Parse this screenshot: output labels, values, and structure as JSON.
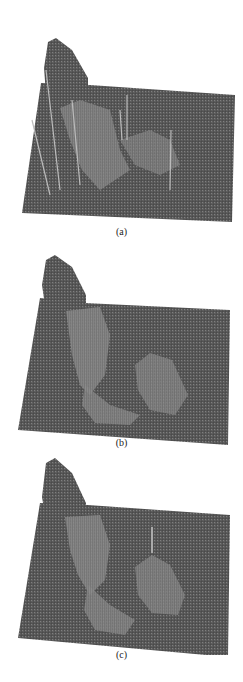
{
  "figure": {
    "panels": [
      {
        "id": "a",
        "label": "(a)",
        "description": "3D surface mesh plot with tall narrow spikes and a raised ridge (noisy)"
      },
      {
        "id": "b",
        "label": "(b)",
        "description": "3D surface mesh plot, smoothed: raised ridge and curved trough, no spikes"
      },
      {
        "id": "c",
        "label": "(c)",
        "description": "3D surface mesh plot, smoothed further: ridge with curved valley and one small peak"
      }
    ]
  },
  "colors": {
    "surface": "#5a5a5a",
    "surface_light": "#9a9a9a",
    "surface_dark": "#3a3a3a",
    "background": "#ffffff"
  }
}
